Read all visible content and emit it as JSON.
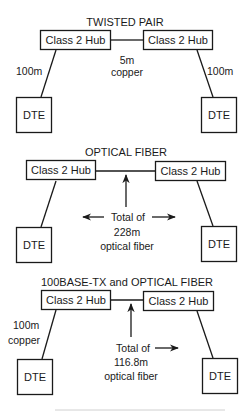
{
  "sections": [
    {
      "title": "TWISTED PAIR",
      "hub_left": "Class 2 Hub",
      "hub_right": "Class 2 Hub",
      "dte_left": "DTE",
      "dte_right": "DTE",
      "left_link_label": [
        "100m"
      ],
      "right_link_label": [
        "100m"
      ],
      "hub_link_label": [
        "5m",
        "copper"
      ]
    },
    {
      "title": "OPTICAL FIBER",
      "hub_left": "Class 2 Hub",
      "hub_right": "Class 2 Hub",
      "dte_left": "DTE",
      "dte_right": "DTE",
      "note": [
        "Total of",
        "228m",
        "optical fiber"
      ]
    },
    {
      "title": "100BASE-TX and OPTICAL FIBER",
      "hub_left": "Class 2 Hub",
      "hub_right": "Class 2 Hub",
      "dte_left": "DTE",
      "dte_right": "DTE",
      "left_link_label": [
        "100m",
        "copper"
      ],
      "note": [
        "Total of",
        "116.8m",
        "optical fiber"
      ]
    }
  ]
}
